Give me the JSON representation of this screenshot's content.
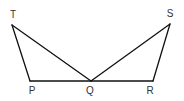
{
  "diagram": {
    "type": "geometry",
    "points": {
      "T": {
        "label": "T",
        "x": 12,
        "y": 25,
        "lx": 13,
        "ly": 18
      },
      "S": {
        "label": "S",
        "x": 170,
        "y": 24,
        "lx": 170,
        "ly": 17
      },
      "P": {
        "label": "P",
        "x": 30,
        "y": 81,
        "lx": 32,
        "ly": 94
      },
      "Q": {
        "label": "Q",
        "x": 91,
        "y": 81,
        "lx": 90,
        "ly": 94
      },
      "R": {
        "label": "R",
        "x": 153,
        "y": 81,
        "lx": 150,
        "ly": 94
      }
    },
    "segments": [
      [
        "T",
        "P"
      ],
      [
        "P",
        "R"
      ],
      [
        "T",
        "Q"
      ],
      [
        "Q",
        "S"
      ],
      [
        "S",
        "R"
      ]
    ],
    "colors": {
      "line": "#111111",
      "label": "#333333"
    }
  }
}
